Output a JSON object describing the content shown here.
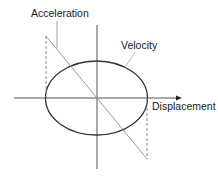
{
  "diagram": {
    "title": "",
    "labels": {
      "acceleration": "Acceleration",
      "velocity": "Velocity",
      "displacement": "Displacement"
    },
    "elements": [
      {
        "type": "axis",
        "orientation": "horizontal",
        "arrow": "right"
      },
      {
        "type": "axis",
        "orientation": "vertical"
      },
      {
        "type": "ellipse",
        "represents": "velocity vs displacement"
      },
      {
        "type": "line",
        "represents": "acceleration vs displacement",
        "slope": "negative"
      },
      {
        "type": "dashed-line",
        "position": "left end"
      },
      {
        "type": "dashed-line",
        "position": "right end"
      }
    ],
    "colors": {
      "axis": "#555555",
      "ellipse": "#333333",
      "acceleration_line": "#9a9a9a",
      "dashed": "#8a8a8a",
      "text": "#1a1a1a"
    }
  }
}
